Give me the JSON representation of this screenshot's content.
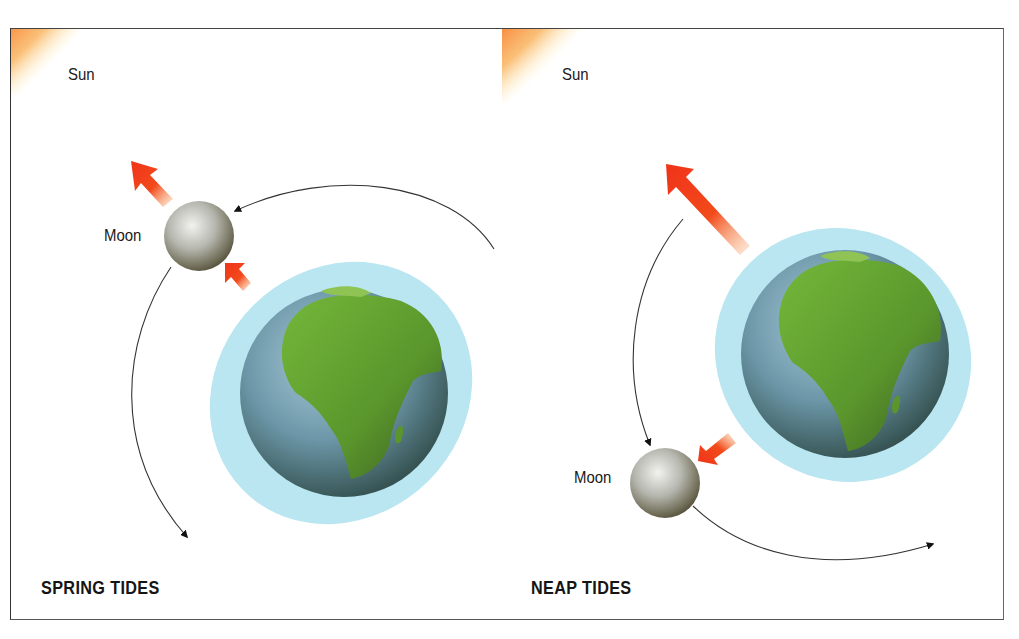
{
  "colors": {
    "sun_core": "#fde94f",
    "sun_mid": "#fba437",
    "sun_edge": "#f55a12",
    "force_arrow": "#f23b16",
    "water": "#b9e6f0",
    "earth_ocean": "#6a98ab",
    "earth_land": "#5ea32b",
    "moon": "#a8a9a2",
    "orbit": "#333333"
  },
  "panels": [
    {
      "id": "spring",
      "title": "SPRING TIDES",
      "sun_label": "Sun",
      "moon_label": "Moon",
      "description": "Sun, Moon and Earth aligned; gravitational pulls combine"
    },
    {
      "id": "neap",
      "title": "NEAP TIDES",
      "sun_label": "Sun",
      "moon_label": "Moon",
      "description": "Moon at right angle to Sun; gravitational pulls partly cancel"
    }
  ]
}
